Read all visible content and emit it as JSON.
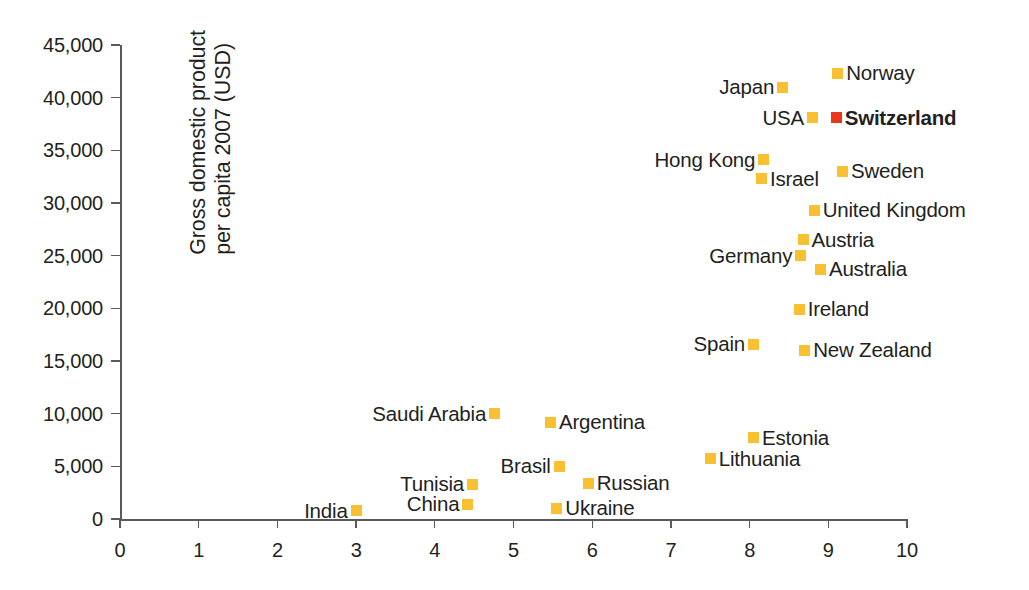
{
  "chart_data": {
    "type": "scatter",
    "title": "",
    "xlabel": "",
    "ylabel": "Gross domestic product per capita 2007 (USD)",
    "ylabel_lines": [
      "Gross domestic product",
      "per capita 2007 (USD)"
    ],
    "xlim": [
      0,
      10
    ],
    "ylim": [
      0,
      45000
    ],
    "xticks": [
      0,
      1,
      2,
      3,
      4,
      5,
      6,
      7,
      8,
      9,
      10
    ],
    "xtick_labels": [
      "0",
      "1",
      "2",
      "3",
      "4",
      "5",
      "6",
      "7",
      "8",
      "9",
      "10"
    ],
    "yticks": [
      0,
      5000,
      10000,
      15000,
      20000,
      25000,
      30000,
      35000,
      40000,
      45000
    ],
    "ytick_labels": [
      "0",
      "5,000",
      "10,000",
      "15,000",
      "20,000",
      "25,000",
      "30,000",
      "35,000",
      "40,000",
      "45,000"
    ],
    "grid": false,
    "legend": "none",
    "colors": {
      "marker": "#f9c132",
      "highlight": "#e8371a",
      "axis": "#58595b",
      "text": "#231f20",
      "background": "#ffffff"
    },
    "points": [
      {
        "name": "Norway",
        "x": 9.12,
        "y": 42300,
        "label_side": "right",
        "highlight": false
      },
      {
        "name": "Japan",
        "x": 8.42,
        "y": 41000,
        "label_side": "left",
        "highlight": false
      },
      {
        "name": "Switzerland",
        "x": 9.1,
        "y": 38100,
        "label_side": "right",
        "highlight": true
      },
      {
        "name": "USA",
        "x": 8.8,
        "y": 38100,
        "label_side": "left",
        "highlight": false
      },
      {
        "name": "Hong Kong",
        "x": 8.18,
        "y": 34100,
        "label_side": "left",
        "highlight": false
      },
      {
        "name": "Sweden",
        "x": 9.18,
        "y": 33000,
        "label_side": "right",
        "highlight": false
      },
      {
        "name": "Israel",
        "x": 8.15,
        "y": 32300,
        "label_side": "right",
        "highlight": false
      },
      {
        "name": "United Kingdom",
        "x": 8.82,
        "y": 29300,
        "label_side": "right",
        "highlight": false
      },
      {
        "name": "Austria",
        "x": 8.68,
        "y": 26500,
        "label_side": "right",
        "highlight": false
      },
      {
        "name": "Germany",
        "x": 8.65,
        "y": 25000,
        "label_side": "left",
        "highlight": false
      },
      {
        "name": "Australia",
        "x": 8.9,
        "y": 23700,
        "label_side": "right",
        "highlight": false
      },
      {
        "name": "Ireland",
        "x": 8.63,
        "y": 19900,
        "label_side": "right",
        "highlight": false
      },
      {
        "name": "New Zealand",
        "x": 8.7,
        "y": 16000,
        "label_side": "right",
        "highlight": false
      },
      {
        "name": "Spain",
        "x": 8.05,
        "y": 16600,
        "label_side": "left",
        "highlight": false
      },
      {
        "name": "Saudi Arabia",
        "x": 4.76,
        "y": 10000,
        "label_side": "left",
        "highlight": false
      },
      {
        "name": "Argentina",
        "x": 5.47,
        "y": 9200,
        "label_side": "right",
        "highlight": false
      },
      {
        "name": "Estonia",
        "x": 8.05,
        "y": 7700,
        "label_side": "right",
        "highlight": false
      },
      {
        "name": "Lithuania",
        "x": 7.5,
        "y": 5700,
        "label_side": "right",
        "highlight": false
      },
      {
        "name": "Brasil",
        "x": 5.58,
        "y": 5000,
        "label_side": "left",
        "highlight": false
      },
      {
        "name": "Tunisia",
        "x": 4.48,
        "y": 3300,
        "label_side": "left",
        "highlight": false
      },
      {
        "name": "Russian",
        "x": 5.95,
        "y": 3400,
        "label_side": "right",
        "highlight": false
      },
      {
        "name": "China",
        "x": 4.42,
        "y": 1400,
        "label_side": "left",
        "highlight": false
      },
      {
        "name": "Ukraine",
        "x": 5.55,
        "y": 1000,
        "label_side": "right",
        "highlight": false
      },
      {
        "name": "India",
        "x": 3.0,
        "y": 800,
        "label_side": "left",
        "highlight": false
      }
    ]
  }
}
